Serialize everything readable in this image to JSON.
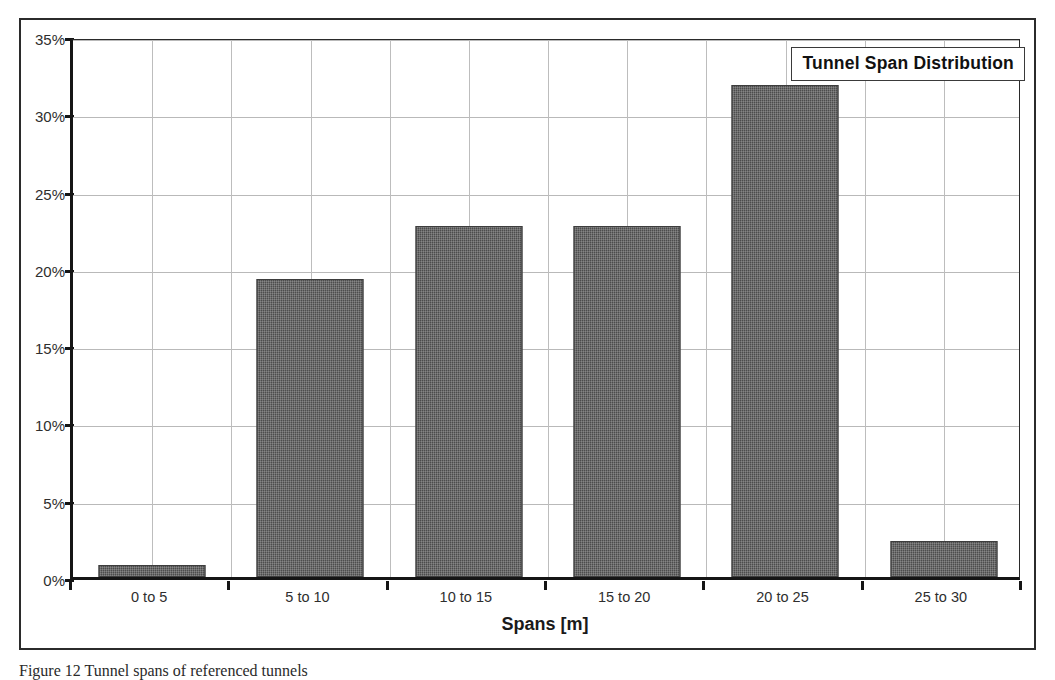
{
  "figure": {
    "caption": "Figure 12 Tunnel spans of referenced tunnels"
  },
  "legend": {
    "label": "Tunnel Span Distribution"
  },
  "colors": {
    "bar_fill": "#5d5d5d",
    "bar_edge": "#3d3d3d",
    "gridline": "#bdbdbd",
    "axis": "#151515",
    "frame": "#2b2b2b",
    "background": "#ffffff",
    "text": "#2e2e2e"
  },
  "chart_data": {
    "type": "bar",
    "title": "Tunnel Span Distribution",
    "xlabel": "Spans [m]",
    "ylabel": "",
    "categories": [
      "0 to 5",
      "5 to 10",
      "10 to 15",
      "15 to 20",
      "20 to 25",
      "25 to 30"
    ],
    "values": [
      0.8,
      19.3,
      22.7,
      22.7,
      31.8,
      2.3
    ],
    "value_unit": "%",
    "ylim": [
      0,
      35
    ],
    "ytick_values": [
      0,
      5,
      10,
      15,
      20,
      25,
      30,
      35
    ],
    "ytick_labels": [
      "0%",
      "5%",
      "10%",
      "15%",
      "20%",
      "25%",
      "30%",
      "35%"
    ],
    "grid": "horizontal-and-vertical",
    "legend_position": "top-right",
    "series": [
      {
        "name": "Tunnel Span Distribution",
        "values": [
          0.8,
          19.3,
          22.7,
          22.7,
          31.8,
          2.3
        ]
      }
    ]
  }
}
